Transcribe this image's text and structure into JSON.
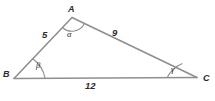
{
  "figure": {
    "background_color": "#ffffff",
    "stroke_color": "#8a8a8a",
    "text_color": "#2b2b2b"
  },
  "vertices": [
    {
      "name": "A",
      "label": "A",
      "x": 72,
      "y": 17
    },
    {
      "name": "B",
      "label": "B",
      "x": 14,
      "y": 78
    },
    {
      "name": "C",
      "label": "C",
      "x": 197,
      "y": 77
    }
  ],
  "sides": [
    {
      "name": "AB",
      "label": "5",
      "from": "B",
      "to": "A"
    },
    {
      "name": "AC",
      "label": "9",
      "from": "A",
      "to": "C"
    },
    {
      "name": "BC",
      "label": "12",
      "from": "B",
      "to": "C"
    }
  ],
  "angles": [
    {
      "name": "alpha",
      "at_vertex": "A",
      "label": "α"
    },
    {
      "name": "beta",
      "at_vertex": "B",
      "label": "β"
    },
    {
      "name": "gamma",
      "at_vertex": "C",
      "label": "γ"
    }
  ]
}
